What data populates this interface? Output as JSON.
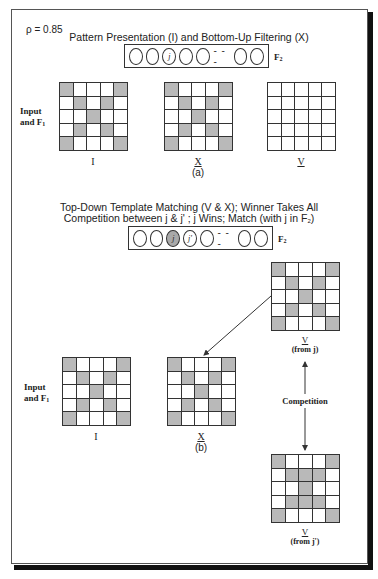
{
  "parameter": "ρ = 0.85",
  "panel_a": {
    "title": "Pattern Presentation (I) and Bottom-Up Filtering (X)",
    "f2": {
      "label": "F",
      "label_sub": "2",
      "nodes": [
        "",
        "",
        "j",
        "",
        "",
        "",
        ""
      ],
      "active": [],
      "ellipsis": "- - -"
    },
    "side_label_line1": "Input",
    "side_label_line2": "and F",
    "side_label_sub": "1",
    "grids": [
      {
        "label": "I",
        "cells": [
          1,
          0,
          0,
          0,
          1,
          0,
          1,
          0,
          1,
          0,
          0,
          0,
          1,
          0,
          0,
          0,
          1,
          0,
          1,
          0,
          1,
          0,
          0,
          0,
          1
        ]
      },
      {
        "label": "X",
        "cells": [
          1,
          0,
          0,
          0,
          1,
          0,
          1,
          0,
          1,
          0,
          0,
          0,
          1,
          0,
          0,
          0,
          1,
          0,
          1,
          0,
          1,
          0,
          0,
          0,
          1
        ]
      },
      {
        "label": "V",
        "cells": [
          0,
          0,
          0,
          0,
          0,
          0,
          0,
          0,
          0,
          0,
          0,
          0,
          0,
          0,
          0,
          0,
          0,
          0,
          0,
          0,
          0,
          0,
          0,
          0,
          0
        ]
      }
    ],
    "caption": "(a)"
  },
  "panel_b": {
    "title_line1": "Top-Down Template Matching (V & X); Winner Takes All",
    "title_line2": "Competition between j & j' ; j Wins; Match (with j in F",
    "title_line2_sub": "2",
    "title_line2_end": ")",
    "f2": {
      "label": "F",
      "label_sub": "2",
      "nodes": [
        "",
        "",
        "j",
        "j'",
        "",
        "",
        ""
      ],
      "active": [
        2
      ],
      "ellipsis": "- - -"
    },
    "side_label_line1": "Input",
    "side_label_line2": "and F",
    "side_label_sub": "1",
    "grids": [
      {
        "label": "I",
        "cells": [
          1,
          0,
          0,
          0,
          1,
          0,
          1,
          0,
          1,
          0,
          0,
          0,
          1,
          0,
          0,
          0,
          1,
          0,
          1,
          0,
          1,
          0,
          0,
          0,
          1
        ]
      },
      {
        "label": "X",
        "cells": [
          1,
          0,
          0,
          0,
          1,
          0,
          1,
          0,
          1,
          0,
          0,
          0,
          1,
          0,
          0,
          0,
          1,
          0,
          1,
          0,
          1,
          0,
          0,
          0,
          1
        ]
      },
      {
        "label": "V",
        "sublabel": "(from j)",
        "cells": [
          1,
          0,
          0,
          0,
          1,
          0,
          1,
          0,
          1,
          0,
          0,
          0,
          1,
          0,
          0,
          0,
          1,
          0,
          1,
          0,
          1,
          0,
          0,
          0,
          1
        ]
      },
      {
        "label": "V",
        "sublabel": "(from j')",
        "cells": [
          1,
          0,
          0,
          0,
          1,
          0,
          1,
          1,
          1,
          0,
          0,
          0,
          1,
          0,
          0,
          0,
          1,
          1,
          1,
          0,
          1,
          0,
          0,
          0,
          1
        ]
      }
    ],
    "competition_label": "Competition",
    "caption": "(b)"
  },
  "colors": {
    "active_cell": "#b9b9b9",
    "active_node": "#a9a9a9",
    "line": "#333333"
  }
}
